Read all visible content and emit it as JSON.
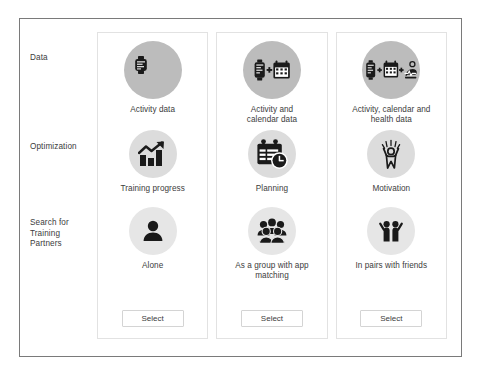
{
  "frame": {
    "label": "option-matrix-frame"
  },
  "row_labels": [
    {
      "name": "row-label-data",
      "text": "Data"
    },
    {
      "name": "row-label-optimization",
      "text": "Optimization"
    },
    {
      "name": "row-label-search-partners",
      "text": "Search for\nTraining\nPartners"
    }
  ],
  "colors": {
    "frame_border": "#7a7a7a",
    "card_border": "#e2e2e2",
    "circle_dark": "#bcbcbc",
    "circle_mid": "#dcdcdc",
    "circle_light": "#e6e6e6",
    "icon": "#1a1a1a",
    "text": "#3c3c3c",
    "button_border": "#d4d4d4",
    "background": "#ffffff"
  },
  "columns": [
    {
      "name": "column-1",
      "options": [
        {
          "icon": "smartwatch-icon",
          "label": "Activity data"
        },
        {
          "icon": "bar-chart-growth-icon",
          "label": "Training progress"
        },
        {
          "icon": "single-person-icon",
          "label": "Alone"
        }
      ],
      "select_label": "Select"
    },
    {
      "name": "column-2",
      "options": [
        {
          "icon": "smartwatch-plus-calendar-icon",
          "label": "Activity and\ncalendar data"
        },
        {
          "icon": "calendar-clock-icon",
          "label": "Planning"
        },
        {
          "icon": "group-of-people-icon",
          "label": "As a group with app\nmatching"
        }
      ],
      "select_label": "Select"
    },
    {
      "name": "column-3",
      "options": [
        {
          "icon": "smartwatch-calendar-health-icon",
          "label": "Activity, calendar and\nhealth data"
        },
        {
          "icon": "cheering-person-icon",
          "label": "Motivation"
        },
        {
          "icon": "two-people-icon",
          "label": "In pairs with friends"
        }
      ],
      "select_label": "Select"
    }
  ]
}
